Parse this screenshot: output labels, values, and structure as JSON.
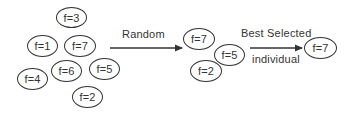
{
  "diagram": {
    "population": {
      "nodes": [
        {
          "label": "f=3",
          "cx": 71,
          "cy": 17
        },
        {
          "label": "f=1",
          "cx": 42,
          "cy": 46
        },
        {
          "label": "f=7",
          "cx": 80,
          "cy": 46
        },
        {
          "label": "f=4",
          "cx": 33,
          "cy": 79
        },
        {
          "label": "f=6",
          "cx": 66,
          "cy": 71
        },
        {
          "label": "f=5",
          "cx": 104,
          "cy": 69
        },
        {
          "label": "f=2",
          "cx": 87,
          "cy": 97
        }
      ]
    },
    "arrow1": {
      "label": "Random",
      "x1": 110,
      "x2": 182,
      "y": 48
    },
    "tournament": {
      "nodes": [
        {
          "label": "f=7",
          "cx": 199,
          "cy": 39
        },
        {
          "label": "f=5",
          "cx": 230,
          "cy": 55
        },
        {
          "label": "f=2",
          "cx": 206,
          "cy": 71
        }
      ]
    },
    "arrow2": {
      "label_top": "Best Selected",
      "label_bottom": "individual",
      "x1": 250,
      "x2": 302,
      "y": 48
    },
    "winner": {
      "nodes": [
        {
          "label": "f=7",
          "cx": 320,
          "cy": 48
        }
      ]
    },
    "colors": {
      "stroke": "#333333",
      "text": "#333333",
      "background": "#ffffff"
    }
  }
}
